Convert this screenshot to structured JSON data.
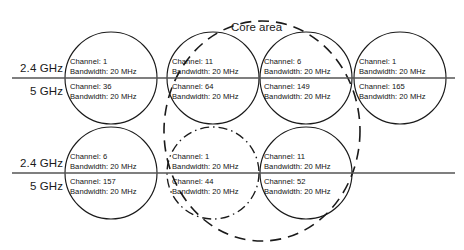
{
  "figure": {
    "core_area_label": "Core area",
    "band_labels": {
      "upper_24": "2.4 GHz",
      "upper_5": "5 GHz",
      "lower_24": "2.4 GHz",
      "lower_5": "5 GHz"
    },
    "colors": {
      "stroke": "#1a1a1a",
      "divider": "#555555",
      "text": "#111111",
      "background": "#ffffff"
    }
  },
  "cells": [
    {
      "id": "top-1",
      "row": "top",
      "cx": 111,
      "cy": 78,
      "r": 46,
      "style": "solid",
      "in_core_area": false,
      "band_24": {
        "channel_label": "Channel: 1",
        "bandwidth_label": "Bandwidth: 20 MHz",
        "channel": 1,
        "bandwidth_mhz": 20
      },
      "band_5": {
        "channel_label": "Channel: 36",
        "bandwidth_label": "Bandwidth: 20 MHz",
        "channel": 36,
        "bandwidth_mhz": 20
      }
    },
    {
      "id": "top-2",
      "row": "top",
      "cx": 213,
      "cy": 78,
      "r": 46,
      "style": "solid",
      "in_core_area": true,
      "band_24": {
        "channel_label": "Channel: 11",
        "bandwidth_label": "Bandwidth: 20 MHz",
        "channel": 11,
        "bandwidth_mhz": 20
      },
      "band_5": {
        "channel_label": "Channel: 64",
        "bandwidth_label": "Bandwidth: 20 MHz",
        "channel": 64,
        "bandwidth_mhz": 20
      }
    },
    {
      "id": "top-3",
      "row": "top",
      "cx": 306,
      "cy": 78,
      "r": 46,
      "style": "solid",
      "in_core_area": true,
      "band_24": {
        "channel_label": "Channel: 6",
        "bandwidth_label": "Bandwidth: 20 MHz",
        "channel": 6,
        "bandwidth_mhz": 20
      },
      "band_5": {
        "channel_label": "Channel: 149",
        "bandwidth_label": "Bandwidth: 20 MHz",
        "channel": 149,
        "bandwidth_mhz": 20
      }
    },
    {
      "id": "top-4",
      "row": "top",
      "cx": 400,
      "cy": 78,
      "r": 46,
      "style": "solid",
      "in_core_area": false,
      "band_24": {
        "channel_label": "Channel: 1",
        "bandwidth_label": "Bandwidth: 20 MHz",
        "channel": 1,
        "bandwidth_mhz": 20
      },
      "band_5": {
        "channel_label": "Channel: 165",
        "bandwidth_label": "Bandwidth: 20 MHz",
        "channel": 165,
        "bandwidth_mhz": 20
      }
    },
    {
      "id": "bottom-1",
      "row": "bottom",
      "cx": 111,
      "cy": 173,
      "r": 46,
      "style": "solid",
      "in_core_area": false,
      "band_24": {
        "channel_label": "Channel: 6",
        "bandwidth_label": "Bandwidth: 20 MHz",
        "channel": 6,
        "bandwidth_mhz": 20
      },
      "band_5": {
        "channel_label": "Channel: 157",
        "bandwidth_label": "Bandwidth: 20 MHz",
        "channel": 157,
        "bandwidth_mhz": 20
      }
    },
    {
      "id": "bottom-2",
      "row": "bottom",
      "cx": 213,
      "cy": 173,
      "r": 46,
      "style": "dash-dot",
      "in_core_area": true,
      "band_24": {
        "channel_label": "Channel: 1",
        "bandwidth_label": "Bandwidth: 20 MHz",
        "channel": 1,
        "bandwidth_mhz": 20
      },
      "band_5": {
        "channel_label": "Channel: 44",
        "bandwidth_label": "Bandwidth: 20 MHz",
        "channel": 44,
        "bandwidth_mhz": 20
      }
    },
    {
      "id": "bottom-3",
      "row": "bottom",
      "cx": 306,
      "cy": 173,
      "r": 46,
      "style": "solid",
      "in_core_area": true,
      "band_24": {
        "channel_label": "Channel: 11",
        "bandwidth_label": "Bandwidth: 20 MHz",
        "channel": 11,
        "bandwidth_mhz": 20
      },
      "band_5": {
        "channel_label": "Channel: 52",
        "bandwidth_label": "Bandwidth: 20 MHz",
        "channel": 52,
        "bandwidth_mhz": 20
      }
    }
  ]
}
